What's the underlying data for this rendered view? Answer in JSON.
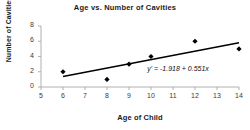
{
  "chart_data": {
    "type": "scatter",
    "title": "Age vs. Number of Cavities",
    "xlabel": "Age of Child",
    "ylabel": "Number of Cavities",
    "xlim": [
      5,
      14
    ],
    "ylim": [
      0,
      8
    ],
    "xticks": [
      5,
      6,
      7,
      8,
      9,
      10,
      11,
      12,
      13,
      14
    ],
    "yticks": [
      0,
      2,
      4,
      6,
      8
    ],
    "grid": false,
    "legend": "none",
    "x": [
      6,
      8,
      9,
      10,
      12,
      14
    ],
    "y": [
      2,
      1,
      3,
      4,
      6,
      5
    ],
    "points": [
      {
        "x": 6,
        "y": 2
      },
      {
        "x": 8,
        "y": 1
      },
      {
        "x": 9,
        "y": 3
      },
      {
        "x": 10,
        "y": 4
      },
      {
        "x": 12,
        "y": 6
      },
      {
        "x": 14,
        "y": 5
      }
    ],
    "marker": "diamond",
    "marker_color": "#000000",
    "trendline": {
      "equation_text": "y' = -1.918 + 0.551x",
      "intercept": -1.918,
      "slope": 0.551,
      "color": "#000000",
      "x_start": 6,
      "x_end": 14
    },
    "annotations": [
      {
        "name": "regression-equation",
        "text": "y' = -1.918 + 0.551x",
        "x": 11.1,
        "y": 2.25
      }
    ],
    "axis_color": "#b0b0b0",
    "background": "#ffffff"
  }
}
